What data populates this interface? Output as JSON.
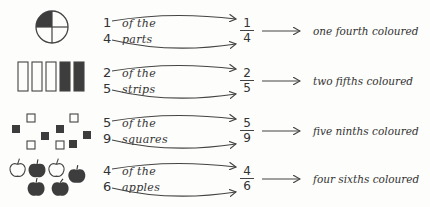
{
  "rows": [
    {
      "figure": "circle-quarters",
      "shaded": 1,
      "total": 4,
      "numerator": "1",
      "denominator": "4",
      "line1": "of the",
      "line2": "parts",
      "description": "one fourth coloured"
    },
    {
      "figure": "strips",
      "shaded": 2,
      "total": 5,
      "numerator": "2",
      "denominator": "5",
      "line1": "of the",
      "line2": "strips",
      "description": "two fifths coloured"
    },
    {
      "figure": "squares",
      "shaded": 5,
      "total": 9,
      "numerator": "5",
      "denominator": "9",
      "line1": "of the",
      "line2": "squares",
      "description": "five ninths coloured"
    },
    {
      "figure": "apples",
      "shaded": 4,
      "total": 6,
      "numerator": "4",
      "denominator": "6",
      "line1": "of the",
      "line2": "apples",
      "description": "four sixths coloured"
    }
  ],
  "colors": {
    "shade": "#3d3d3d",
    "stroke": "#444444",
    "background": "#fdfdfb"
  }
}
